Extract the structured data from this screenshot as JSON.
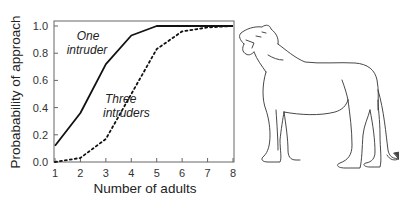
{
  "chart_data": {
    "type": "line",
    "title": "",
    "xlabel": "Number of adults",
    "ylabel": "Probabability of approach",
    "x": [
      1,
      2,
      3,
      4,
      5,
      6,
      7,
      8
    ],
    "xlim": [
      1,
      8
    ],
    "ylim": [
      0,
      1.0
    ],
    "xticks": [
      "1",
      "2",
      "3",
      "4",
      "5",
      "6",
      "7",
      "8"
    ],
    "yticks": [
      "0.0",
      "0.2",
      "0.4",
      "0.6",
      "0.8",
      "1.0"
    ],
    "grid": false,
    "legend": "inline annotations",
    "series": [
      {
        "name": "One intruder",
        "style": "solid",
        "values": [
          0.12,
          0.36,
          0.72,
          0.93,
          1.0,
          1.0,
          1.0,
          1.0
        ]
      },
      {
        "name": "Three intruders",
        "style": "dotted",
        "values": [
          0.0,
          0.03,
          0.17,
          0.5,
          0.83,
          0.96,
          0.99,
          1.0
        ]
      }
    ],
    "annotations": [
      {
        "text_line1": "One",
        "text_line2": "intruder",
        "near_series": "One intruder"
      },
      {
        "text_line1": "Three",
        "text_line2": "intruders",
        "near_series": "Three intruders"
      }
    ]
  },
  "illustration": {
    "subject": "lioness-drawing",
    "description": "Line drawing of a lioness roaring, standing to the right of the chart"
  }
}
